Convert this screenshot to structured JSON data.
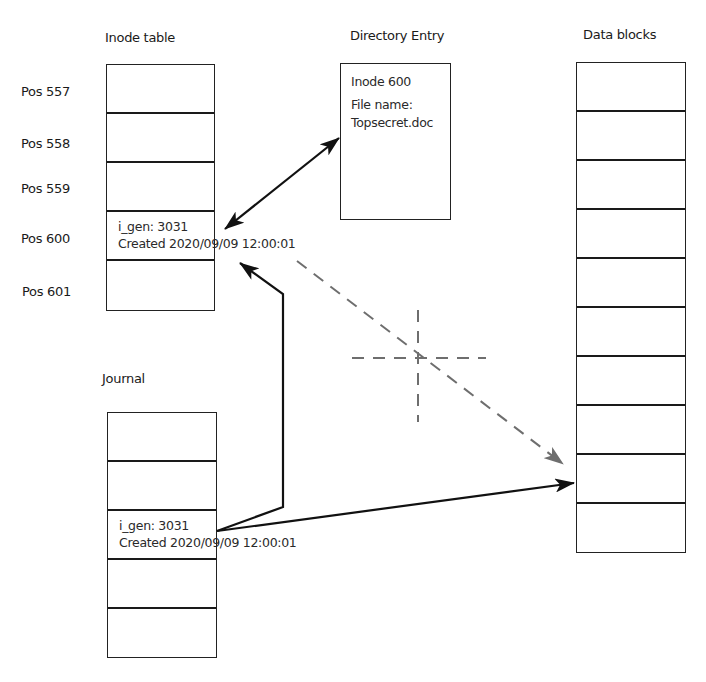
{
  "inode_table": {
    "title": "Inode table",
    "rows": [
      {
        "pos_label": "Pos 557",
        "line1": "",
        "line2": ""
      },
      {
        "pos_label": "Pos 558",
        "line1": "",
        "line2": ""
      },
      {
        "pos_label": "Pos 559",
        "line1": "",
        "line2": ""
      },
      {
        "pos_label": "Pos 600",
        "line1": "i_gen: 3031",
        "line2": "Created 2020/09/09 12:00:01"
      },
      {
        "pos_label": "Pos 601",
        "line1": "",
        "line2": ""
      }
    ]
  },
  "directory_entry": {
    "title": "Directory Entry",
    "inode": "Inode 600",
    "file_name_label": "File name:",
    "file_name": "Topsecret.doc"
  },
  "data_blocks": {
    "title": "Data blocks",
    "block_count": 10
  },
  "journal": {
    "title": "Journal",
    "rows": [
      {
        "line1": "",
        "line2": ""
      },
      {
        "line1": "",
        "line2": ""
      },
      {
        "line1": "i_gen: 3031",
        "line2": "Created 2020/09/09 12:00:01"
      },
      {
        "line1": "",
        "line2": ""
      },
      {
        "line1": "",
        "line2": ""
      }
    ]
  },
  "colors": {
    "line": "#1a1a1a",
    "dashed": "#6e6e6e"
  }
}
